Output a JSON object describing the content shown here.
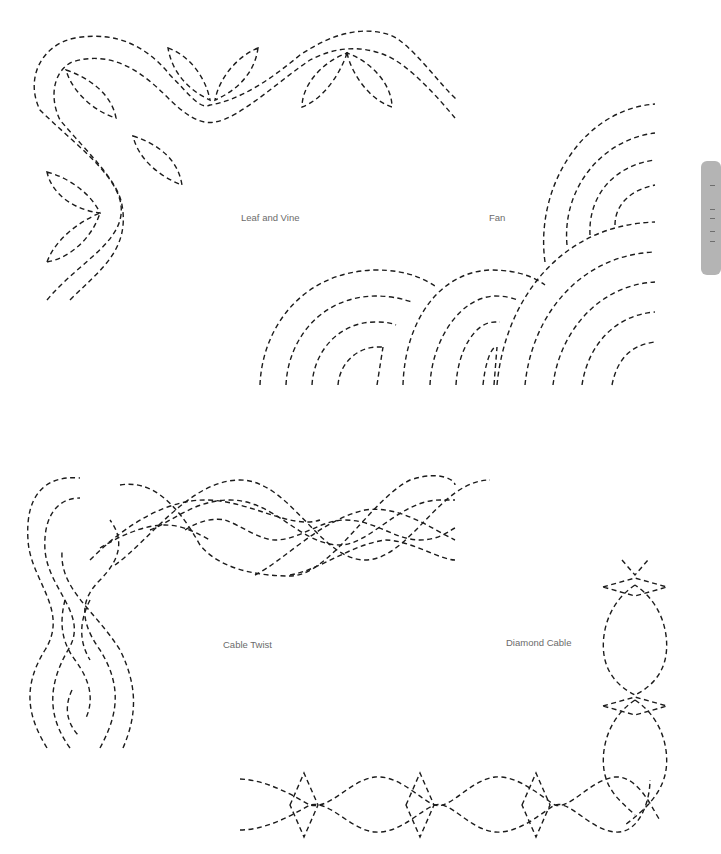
{
  "page": {
    "background": "#ffffff",
    "stitch_color": "#1c1c1c",
    "label_color": "#6b6b6b",
    "tab_color": "#b4b4b4"
  },
  "patterns": [
    {
      "id": "leaf-and-vine",
      "label": "Leaf and Vine"
    },
    {
      "id": "fan",
      "label": "Fan"
    },
    {
      "id": "cable-twist",
      "label": "Cable Twist"
    },
    {
      "id": "diamond-cable",
      "label": "Diamond Cable"
    }
  ],
  "side_tab": {
    "icon": "thumb-index-tab"
  }
}
